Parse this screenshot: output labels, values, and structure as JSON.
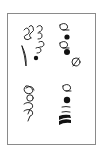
{
  "figure": {
    "caption": "",
    "frame_color": "#8a8a8a",
    "ink_color": "#111111",
    "background": "#ffffff",
    "groups": [
      {
        "id": "top-left",
        "description": "cluster of looped stroke glyphs with tapered teardrop stroke and small filled dot"
      },
      {
        "id": "top-right",
        "description": "vertical column of alternating outline loops and filled dots ending in circled slash glyph"
      },
      {
        "id": "bottom-left",
        "description": "looped glyphs with circle and hooked strokes"
      },
      {
        "id": "bottom-right",
        "description": "column of outline loop, filled dot, thin hooks and heavy filled wedge strokes"
      }
    ]
  }
}
